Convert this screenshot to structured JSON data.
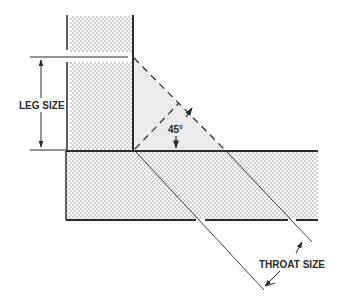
{
  "diagram": {
    "type": "fillet-weld-cross-section",
    "labels": {
      "leg_size": "LEG SIZE",
      "angle": "45°",
      "throat_size": "THROAT SIZE"
    },
    "colors": {
      "line": "#2a2a2a",
      "weld_fill": "#ebebeb",
      "plate_dots": "#8a8a8a",
      "background": "#ffffff"
    }
  }
}
